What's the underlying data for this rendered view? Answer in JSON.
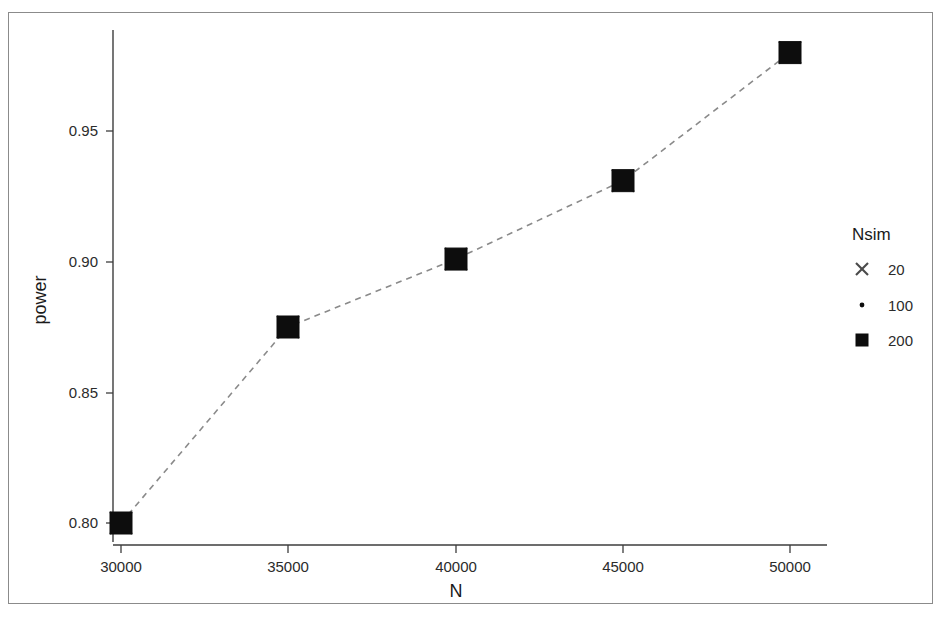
{
  "chart_data": {
    "type": "line",
    "title": "",
    "xlabel": "N",
    "ylabel": "power",
    "xlim": [
      29000,
      51000
    ],
    "ylim": [
      0.783,
      0.992
    ],
    "grid": false,
    "x": [
      30000,
      35000,
      40000,
      45000,
      50000
    ],
    "xticks": [
      "30000",
      "35000",
      "40000",
      "45000",
      "50000"
    ],
    "yticks": [
      "0.80",
      "0.85",
      "0.90",
      "0.95"
    ],
    "ytick_values": [
      0.8,
      0.85,
      0.9,
      0.95
    ],
    "legend": {
      "title": "Nsim",
      "position": "right",
      "entries": [
        {
          "label": "20",
          "marker": "cross-marker"
        },
        {
          "label": "100",
          "marker": "dot-marker"
        },
        {
          "label": "200",
          "marker": "square-marker"
        }
      ]
    },
    "series": [
      {
        "name": "20",
        "marker": "cross-marker",
        "values": [
          0.8,
          0.875,
          0.901,
          0.931,
          0.98
        ]
      },
      {
        "name": "100",
        "marker": "dot-marker",
        "values": [
          0.8,
          0.875,
          0.901,
          0.931,
          0.98
        ]
      },
      {
        "name": "200",
        "marker": "square-marker",
        "values": [
          0.8,
          0.875,
          0.901,
          0.931,
          0.98
        ]
      }
    ],
    "connector": {
      "style": "dashed",
      "color": "#8a8a8a",
      "values": [
        0.8,
        0.875,
        0.901,
        0.931,
        0.98
      ]
    },
    "colors": {
      "marker": "#0d0d0d",
      "line": "#8a8a8a",
      "axis": "#3d3d3d",
      "text": "#1a1a1a"
    }
  },
  "axis": {
    "x_title": "N",
    "y_title": "power",
    "xticks": [
      "30000",
      "35000",
      "40000",
      "45000",
      "50000"
    ],
    "yticks": [
      "0.95",
      "0.90",
      "0.85",
      "0.80"
    ]
  },
  "legend": {
    "title": "Nsim",
    "item_20": "20",
    "item_100": "100",
    "item_200": "200"
  }
}
